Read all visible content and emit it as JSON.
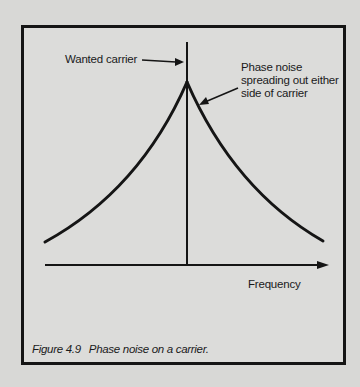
{
  "figure": {
    "labels": {
      "wanted_carrier": "Wanted carrier",
      "phase_noise_line1": "Phase noise",
      "phase_noise_line2": "spreading out either",
      "phase_noise_line3": "side of carrier",
      "x_axis": "Frequency"
    },
    "caption": {
      "number": "Figure 4.9",
      "text": "Phase noise on a carrier."
    },
    "colors": {
      "ink": "#151515",
      "paper": "#dcdcda"
    }
  }
}
